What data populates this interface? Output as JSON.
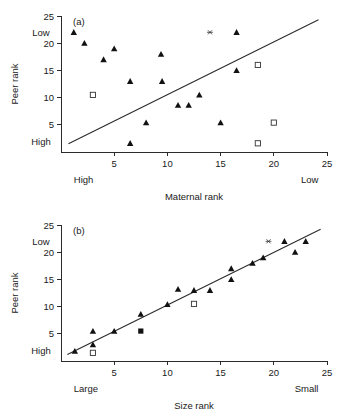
{
  "figure": {
    "background": "#ffffff",
    "ink_color": "#1a1a1a"
  },
  "chart_data": [
    {
      "type": "scatter",
      "panel_label": "(a)",
      "title": "",
      "xlabel": "Maternal rank",
      "ylabel": "Peer rank",
      "xlim": [
        0,
        25
      ],
      "ylim": [
        0,
        25
      ],
      "grid": false,
      "legend": "none",
      "xticks": [
        5,
        10,
        15,
        20,
        25
      ],
      "yticks": [
        5,
        10,
        15,
        20,
        25
      ],
      "x_axis_low_end_label": "High",
      "x_axis_high_end_label": "Low",
      "y_axis_low_end_label": "High",
      "y_axis_high_end_label": "Low",
      "series": [
        {
          "name": "filled-triangle",
          "marker": "triangle",
          "points": [
            [
              1.2,
              22.0
            ],
            [
              2.2,
              20.0
            ],
            [
              4.0,
              17.0
            ],
            [
              5.0,
              19.0
            ],
            [
              6.5,
              13.0
            ],
            [
              6.5,
              1.6
            ],
            [
              8.0,
              5.4
            ],
            [
              9.4,
              18.0
            ],
            [
              9.5,
              13.0
            ],
            [
              11.0,
              8.6
            ],
            [
              12.0,
              8.6
            ],
            [
              13.0,
              10.5
            ],
            [
              15.0,
              5.4
            ],
            [
              16.5,
              22.0
            ],
            [
              16.5,
              15.0
            ]
          ]
        },
        {
          "name": "open-square",
          "marker": "square-open",
          "points": [
            [
              3.0,
              10.5
            ],
            [
              18.5,
              16.0
            ],
            [
              18.5,
              1.6
            ],
            [
              20.0,
              5.4
            ]
          ]
        },
        {
          "name": "asterisk",
          "marker": "asterisk",
          "points": [
            [
              14.0,
              22.0
            ]
          ]
        }
      ],
      "fit_line": {
        "name": "diagonal-reference-line",
        "x0": 0.7,
        "y0": 1.5,
        "x1": 24.2,
        "y1": 24.3
      }
    },
    {
      "type": "scatter",
      "panel_label": "(b)",
      "title": "",
      "xlabel": "Size rank",
      "ylabel": "Peer rank",
      "xlim": [
        0,
        25
      ],
      "ylim": [
        0,
        25
      ],
      "grid": false,
      "legend": "none",
      "xticks": [
        5,
        10,
        15,
        20,
        25
      ],
      "yticks": [
        5,
        10,
        15,
        20,
        25
      ],
      "x_axis_low_end_label": "Large",
      "x_axis_high_end_label": "Small",
      "y_axis_low_end_label": "High",
      "y_axis_high_end_label": "Low",
      "series": [
        {
          "name": "filled-triangle",
          "marker": "triangle",
          "points": [
            [
              1.3,
              1.8
            ],
            [
              3.0,
              3.0
            ],
            [
              3.0,
              5.5
            ],
            [
              5.0,
              5.5
            ],
            [
              7.5,
              8.6
            ],
            [
              10.0,
              10.4
            ],
            [
              11.0,
              13.2
            ],
            [
              12.5,
              13.0
            ],
            [
              14.0,
              13.0
            ],
            [
              16.0,
              17.0
            ],
            [
              16.0,
              15.0
            ],
            [
              18.0,
              18.0
            ],
            [
              19.0,
              19.0
            ],
            [
              21.0,
              22.0
            ],
            [
              22.0,
              20.0
            ],
            [
              23.0,
              22.0
            ]
          ]
        },
        {
          "name": "open-square",
          "marker": "square-open",
          "points": [
            [
              3.0,
              1.5
            ],
            [
              12.5,
              10.5
            ]
          ]
        },
        {
          "name": "filled-square",
          "marker": "square-filled",
          "points": [
            [
              7.5,
              5.5
            ]
          ]
        },
        {
          "name": "asterisk",
          "marker": "asterisk",
          "points": [
            [
              19.5,
              22.0
            ]
          ]
        }
      ],
      "fit_line": {
        "name": "regression-line",
        "x0": 0.6,
        "y0": 1.2,
        "x1": 24.4,
        "y1": 24.2
      }
    }
  ]
}
